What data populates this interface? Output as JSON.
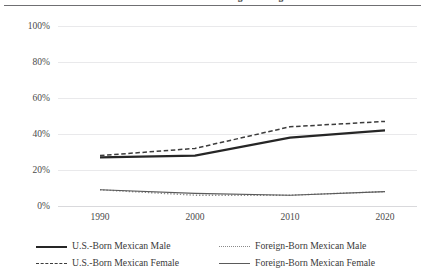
{
  "chart_data": {
    "type": "line",
    "title": "Share with a Bachelor's Degree or Higher",
    "xlabel": "",
    "ylabel": "",
    "x": [
      1990,
      2000,
      2010,
      2020
    ],
    "xtick_labels": [
      "1990",
      "2000",
      "2010",
      "2020"
    ],
    "ytick_labels": [
      "0%",
      "20%",
      "40%",
      "60%",
      "80%",
      "100%"
    ],
    "ytick_values": [
      0,
      20,
      40,
      60,
      80,
      100
    ],
    "ylim": [
      0,
      100
    ],
    "xlim": [
      1988,
      2022
    ],
    "grid": "horizontal",
    "legend_position": "bottom",
    "series": [
      {
        "name": "U.S.-Born Mexican Male",
        "style": "solid-thick",
        "color": "#262626",
        "values": [
          27,
          28,
          38,
          42
        ]
      },
      {
        "name": "U.S.-Born Mexican Female",
        "style": "dashed",
        "color": "#3c3c3c",
        "values": [
          28,
          32,
          44,
          47
        ]
      },
      {
        "name": "Foreign-Born Mexican Male",
        "style": "dotted",
        "color": "#8a8a8a",
        "values": [
          9,
          6,
          6,
          8
        ]
      },
      {
        "name": "Foreign-Born Mexican Female",
        "style": "solid-thin",
        "color": "#5a5a5a",
        "values": [
          9,
          7,
          6,
          8
        ]
      }
    ]
  },
  "axis": {
    "y": {
      "t100": "100%",
      "t80": "80%",
      "t60": "60%",
      "t40": "40%",
      "t20": "20%",
      "t0": "0%"
    },
    "x": {
      "t1990": "1990",
      "t2000": "2000",
      "t2010": "2010",
      "t2020": "2020"
    }
  },
  "legend": {
    "items": [
      {
        "label": "U.S.-Born Mexican Male"
      },
      {
        "label": "U.S.-Born Mexican Female"
      },
      {
        "label": "Foreign-Born Mexican Male"
      },
      {
        "label": "Foreign-Born Mexican Female"
      }
    ]
  }
}
